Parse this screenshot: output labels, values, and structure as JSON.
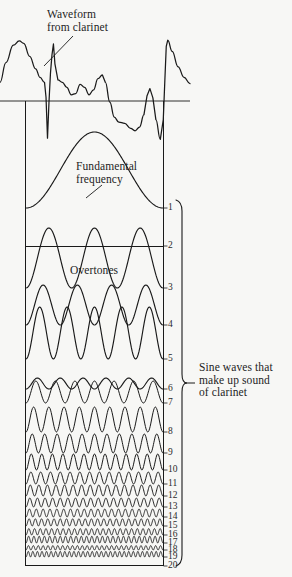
{
  "figure": {
    "background_color": "#f7f7f5",
    "ink_color": "#1a1a1a",
    "annotations": {
      "waveform_label": "Waveform\nfrom clarinet",
      "fundamental_label": "Fundamental\nfrequency",
      "overtones_label": "Overtones",
      "sine_label": "Sine waves that\nmake up sound\nof clarinet"
    },
    "harmonic_numbers": [
      "1",
      "2",
      "3",
      "4",
      "5",
      "6",
      "7",
      "8",
      "9",
      "10",
      "11",
      "12",
      "13",
      "14",
      "15",
      "16",
      "17",
      "18",
      "19",
      "20"
    ]
  },
  "chart_data": {
    "type": "line",
    "title": "Waveform from clarinet",
    "xlabel": "",
    "ylabel": "",
    "grid": false,
    "legend": "none",
    "panels": [
      {
        "name": "composite-waveform",
        "label": "Waveform from clarinet",
        "has_axis_line": true,
        "axis_y_fraction": 0.5,
        "cycles": 2
      },
      {
        "name": "harmonic-stack",
        "label": "Sine waves that make up sound of clarinet",
        "series": [
          {
            "harmonic": 1,
            "label": "1",
            "cycles": 1,
            "amplitude": 1.0
          },
          {
            "harmonic": 2,
            "label": "2",
            "cycles": 2,
            "amplitude": 0.0
          },
          {
            "harmonic": 3,
            "label": "3",
            "cycles": 3,
            "amplitude": 0.86
          },
          {
            "harmonic": 4,
            "label": "4",
            "cycles": 4,
            "amplitude": 0.44
          },
          {
            "harmonic": 5,
            "label": "5",
            "cycles": 5,
            "amplitude": 0.62
          },
          {
            "harmonic": 6,
            "label": "6",
            "cycles": 6,
            "amplitude": 0.1
          },
          {
            "harmonic": 7,
            "label": "7",
            "cycles": 7,
            "amplitude": 0.3
          },
          {
            "harmonic": 8,
            "label": "8",
            "cycles": 9,
            "amplitude": 0.36
          },
          {
            "harmonic": 9,
            "label": "9",
            "cycles": 11,
            "amplitude": 0.26
          },
          {
            "harmonic": 10,
            "label": "10",
            "cycles": 13,
            "amplitude": 0.22
          },
          {
            "harmonic": 11,
            "label": "11",
            "cycles": 14,
            "amplitude": 0.16
          },
          {
            "harmonic": 12,
            "label": "12",
            "cycles": 16,
            "amplitude": 0.15
          },
          {
            "harmonic": 13,
            "label": "13",
            "cycles": 18,
            "amplitude": 0.12
          },
          {
            "harmonic": 14,
            "label": "14",
            "cycles": 20,
            "amplitude": 0.11
          },
          {
            "harmonic": 15,
            "label": "15",
            "cycles": 22,
            "amplitude": 0.1
          },
          {
            "harmonic": 16,
            "label": "16",
            "cycles": 24,
            "amplitude": 0.09
          },
          {
            "harmonic": 17,
            "label": "17",
            "cycles": 26,
            "amplitude": 0.1
          },
          {
            "harmonic": 18,
            "label": "18",
            "cycles": 28,
            "amplitude": 0.06
          },
          {
            "harmonic": 19,
            "label": "19",
            "cycles": 30,
            "amplitude": 0.08
          },
          {
            "harmonic": 20,
            "label": "20",
            "cycles": 32,
            "amplitude": 0.0
          }
        ]
      }
    ],
    "composite_points": [
      [
        0,
        0.3
      ],
      [
        4,
        0.62
      ],
      [
        9,
        0.9
      ],
      [
        13,
        0.97
      ],
      [
        16,
        0.93
      ],
      [
        20,
        0.72
      ],
      [
        24,
        0.52
      ],
      [
        27,
        0.38
      ],
      [
        30,
        0.3
      ],
      [
        31,
        0.06
      ],
      [
        32,
        -0.6
      ],
      [
        33,
        -0.02
      ],
      [
        34,
        0.45
      ],
      [
        35,
        0.74
      ],
      [
        36,
        0.92
      ],
      [
        37,
        0.6
      ],
      [
        39,
        0.34
      ],
      [
        42,
        0.3
      ],
      [
        45,
        0.22
      ],
      [
        48,
        0.1
      ],
      [
        51,
        0.12
      ],
      [
        54,
        0.27
      ],
      [
        57,
        0.22
      ],
      [
        60,
        0.1
      ],
      [
        63,
        0.18
      ],
      [
        66,
        0.36
      ],
      [
        69,
        0.42
      ],
      [
        71,
        0.3
      ],
      [
        74,
        -0.02
      ],
      [
        77,
        -0.26
      ],
      [
        80,
        -0.34
      ],
      [
        84,
        -0.36
      ],
      [
        88,
        -0.44
      ],
      [
        91,
        -0.48
      ],
      [
        94,
        -0.42
      ],
      [
        97,
        -0.22
      ],
      [
        99,
        0.08
      ],
      [
        101,
        0.2
      ],
      [
        103,
        0.05
      ],
      [
        105,
        -0.3
      ],
      [
        108,
        -0.62
      ],
      [
        110,
        -0.3
      ],
      [
        111,
        0.3
      ],
      [
        112,
        0.88
      ],
      [
        113,
        0.98
      ],
      [
        116,
        0.8
      ],
      [
        120,
        0.55
      ],
      [
        124,
        0.38
      ],
      [
        128,
        0.28
      ]
    ]
  }
}
